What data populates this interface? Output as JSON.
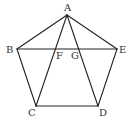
{
  "figure": {
    "type": "geometry-diagram",
    "colors": {
      "line": "#222222",
      "label": "#333333",
      "background": "#ffffff"
    },
    "points": {
      "A": {
        "label": "A",
        "x": 67,
        "y": 15
      },
      "B": {
        "label": "B",
        "x": 17,
        "y": 49
      },
      "C": {
        "label": "C",
        "x": 36,
        "y": 106
      },
      "D": {
        "label": "D",
        "x": 98,
        "y": 106
      },
      "E": {
        "label": "E",
        "x": 117,
        "y": 49
      },
      "F": {
        "label": "F",
        "x": 55,
        "y": 49
      },
      "G": {
        "label": "G",
        "x": 79,
        "y": 49
      }
    },
    "segments": [
      {
        "name": "AB",
        "from": "A",
        "to": "B"
      },
      {
        "name": "BC",
        "from": "B",
        "to": "C"
      },
      {
        "name": "CD",
        "from": "C",
        "to": "D"
      },
      {
        "name": "DE",
        "from": "D",
        "to": "E"
      },
      {
        "name": "EA",
        "from": "E",
        "to": "A"
      },
      {
        "name": "BE",
        "from": "B",
        "to": "E"
      },
      {
        "name": "AC",
        "from": "A",
        "to": "C"
      },
      {
        "name": "AD",
        "from": "A",
        "to": "D"
      }
    ],
    "labels": {
      "A": "A",
      "B": "B",
      "C": "C",
      "D": "D",
      "E": "E",
      "F": "F",
      "G": "G"
    }
  }
}
